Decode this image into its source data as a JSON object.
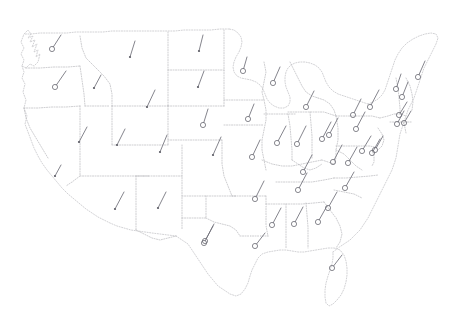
{
  "figure": {
    "title": "",
    "subtitle": "",
    "background_color": "#ffffff",
    "border_color": "#b9b9bd",
    "marker_color": "#6b6b74",
    "shaft_color": "#6f6f78",
    "width": 462,
    "height": 327
  },
  "legend": {
    "present": false,
    "entries": []
  },
  "axes": {
    "present": false,
    "x_ticks": [],
    "y_ticks": []
  },
  "chart_data": {
    "type": "scatter",
    "title": "",
    "subtitle": "",
    "xlabel": "",
    "ylabel": "",
    "grid": false,
    "legend_position": "none",
    "projection": "contiguous-united-states",
    "marker_style": "circle-with-vector-shaft",
    "xlim": [
      0,
      462
    ],
    "ylim": [
      0,
      327
    ],
    "series": [
      {
        "name": "station-wind-vectors",
        "point_count": 50,
        "points": [
          {
            "id": "WA",
            "x": 52,
            "y": 49,
            "dx": 9,
            "dy": -14,
            "marker": "circle"
          },
          {
            "id": "OR",
            "x": 55,
            "y": 87,
            "dx": 11,
            "dy": -16,
            "marker": "circle"
          },
          {
            "id": "ID",
            "x": 94,
            "y": 88,
            "dx": 7,
            "dy": -13,
            "marker": "dot"
          },
          {
            "id": "MT",
            "x": 130,
            "y": 57,
            "dx": 5,
            "dy": -16,
            "marker": "dot"
          },
          {
            "id": "ND",
            "x": 199,
            "y": 51,
            "dx": 4,
            "dy": -16,
            "marker": "dot"
          },
          {
            "id": "SD",
            "x": 198,
            "y": 87,
            "dx": 6,
            "dy": -16,
            "marker": "dot"
          },
          {
            "id": "WY",
            "x": 147,
            "y": 107,
            "dx": 8,
            "dy": -17,
            "marker": "dot"
          },
          {
            "id": "MN",
            "x": 243,
            "y": 71,
            "dx": 4,
            "dy": -14,
            "marker": "circle"
          },
          {
            "id": "WI",
            "x": 273,
            "y": 83,
            "dx": 7,
            "dy": -16,
            "marker": "circle"
          },
          {
            "id": "MI-UP",
            "x": 306,
            "y": 107,
            "dx": 8,
            "dy": -16,
            "marker": "circle"
          },
          {
            "id": "MI",
            "x": 329,
            "y": 135,
            "dx": 9,
            "dy": -17,
            "marker": "circle"
          },
          {
            "id": "NE",
            "x": 203,
            "y": 125,
            "dx": 5,
            "dy": -16,
            "marker": "circle"
          },
          {
            "id": "IA",
            "x": 248,
            "y": 119,
            "dx": 6,
            "dy": -15,
            "marker": "circle"
          },
          {
            "id": "NV",
            "x": 79,
            "y": 142,
            "dx": 8,
            "dy": -15,
            "marker": "dot"
          },
          {
            "id": "UT",
            "x": 117,
            "y": 145,
            "dx": 8,
            "dy": -16,
            "marker": "dot"
          },
          {
            "id": "CO",
            "x": 160,
            "y": 152,
            "dx": 7,
            "dy": -17,
            "marker": "dot"
          },
          {
            "id": "KS",
            "x": 213,
            "y": 155,
            "dx": 8,
            "dy": -18,
            "marker": "dot"
          },
          {
            "id": "MO",
            "x": 252,
            "y": 157,
            "dx": 8,
            "dy": -17,
            "marker": "circle"
          },
          {
            "id": "IL",
            "x": 277,
            "y": 143,
            "dx": 9,
            "dy": -17,
            "marker": "circle"
          },
          {
            "id": "IN",
            "x": 297,
            "y": 144,
            "dx": 9,
            "dy": -18,
            "marker": "circle"
          },
          {
            "id": "OH",
            "x": 322,
            "y": 139,
            "dx": 9,
            "dy": -17,
            "marker": "circle"
          },
          {
            "id": "PA",
            "x": 356,
            "y": 129,
            "dx": 9,
            "dy": -17,
            "marker": "circle"
          },
          {
            "id": "NY",
            "x": 370,
            "y": 107,
            "dx": 9,
            "dy": -17,
            "marker": "circle"
          },
          {
            "id": "VT",
            "x": 396,
            "y": 89,
            "dx": 5,
            "dy": -15,
            "marker": "circle"
          },
          {
            "id": "NH",
            "x": 402,
            "y": 97,
            "dx": 6,
            "dy": -15,
            "marker": "circle"
          },
          {
            "id": "ME",
            "x": 418,
            "y": 77,
            "dx": 7,
            "dy": -16,
            "marker": "circle"
          },
          {
            "id": "MA",
            "x": 399,
            "y": 115,
            "dx": 8,
            "dy": -13,
            "marker": "circle"
          },
          {
            "id": "RI",
            "x": 404,
            "y": 123,
            "dx": 7,
            "dy": -12,
            "marker": "circle"
          },
          {
            "id": "CT",
            "x": 397,
            "y": 124,
            "dx": 7,
            "dy": -13,
            "marker": "circle"
          },
          {
            "id": "NJ",
            "x": 375,
            "y": 150,
            "dx": 8,
            "dy": -14,
            "marker": "circle"
          },
          {
            "id": "DE",
            "x": 372,
            "y": 153,
            "dx": 8,
            "dy": -14,
            "marker": "circle"
          },
          {
            "id": "MD",
            "x": 362,
            "y": 151,
            "dx": 9,
            "dy": -15,
            "marker": "circle"
          },
          {
            "id": "WV",
            "x": 333,
            "y": 162,
            "dx": 9,
            "dy": -17,
            "marker": "circle"
          },
          {
            "id": "VA",
            "x": 348,
            "y": 163,
            "dx": 9,
            "dy": -16,
            "marker": "circle"
          },
          {
            "id": "KY",
            "x": 303,
            "y": 172,
            "dx": 9,
            "dy": -17,
            "marker": "circle"
          },
          {
            "id": "NC",
            "x": 345,
            "y": 188,
            "dx": 9,
            "dy": -16,
            "marker": "circle"
          },
          {
            "id": "TN",
            "x": 298,
            "y": 190,
            "dx": 9,
            "dy": -17,
            "marker": "circle"
          },
          {
            "id": "AR",
            "x": 255,
            "y": 199,
            "dx": 9,
            "dy": -18,
            "marker": "circle"
          },
          {
            "id": "SC",
            "x": 328,
            "y": 208,
            "dx": 9,
            "dy": -16,
            "marker": "circle"
          },
          {
            "id": "GA",
            "x": 318,
            "y": 222,
            "dx": 9,
            "dy": -16,
            "marker": "circle"
          },
          {
            "id": "AL",
            "x": 294,
            "y": 224,
            "dx": 9,
            "dy": -17,
            "marker": "circle"
          },
          {
            "id": "MS",
            "x": 272,
            "y": 225,
            "dx": 9,
            "dy": -17,
            "marker": "circle"
          },
          {
            "id": "LA",
            "x": 255,
            "y": 246,
            "dx": 10,
            "dy": -13,
            "marker": "circle"
          },
          {
            "id": "OK",
            "x": 205,
            "y": 241,
            "dx": 9,
            "dy": -17,
            "marker": "circle"
          },
          {
            "id": "TX",
            "x": 204,
            "y": 243,
            "dx": 9,
            "dy": -17,
            "marker": "circle"
          },
          {
            "id": "FL",
            "x": 332,
            "y": 268,
            "dx": 10,
            "dy": -13,
            "marker": "circle"
          },
          {
            "id": "NM",
            "x": 158,
            "y": 208,
            "dx": 8,
            "dy": -16,
            "marker": "dot"
          },
          {
            "id": "AZ",
            "x": 115,
            "y": 209,
            "dx": 9,
            "dy": -17,
            "marker": "dot"
          },
          {
            "id": "CA",
            "x": 55,
            "y": 176,
            "dx": 6,
            "dy": -11,
            "marker": "dot"
          },
          {
            "id": "NY-W",
            "x": 353,
            "y": 115,
            "dx": 8,
            "dy": -16,
            "marker": "circle"
          }
        ]
      }
    ]
  }
}
